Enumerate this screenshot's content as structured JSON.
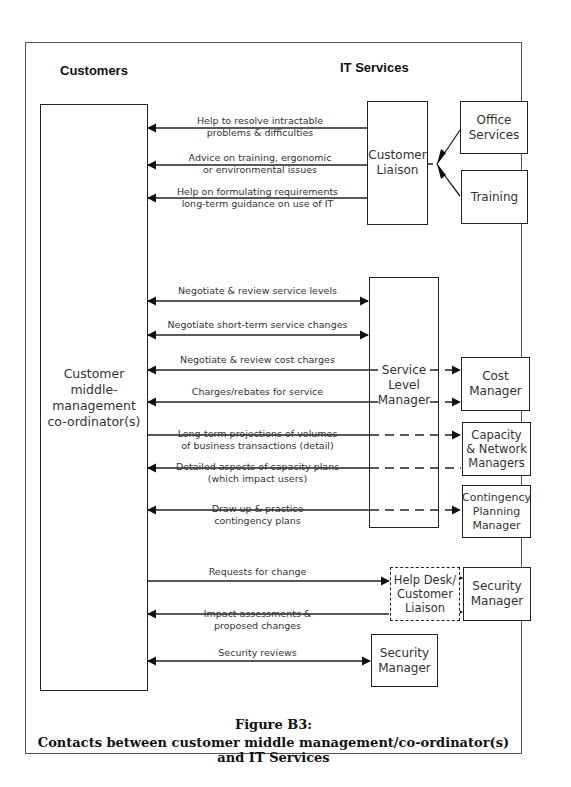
{
  "headers": {
    "customers": "Customers",
    "it_services": "IT Services"
  },
  "boxes": {
    "customer": "Customer\nmiddle-\nmanagement\nco-ordinator(s)",
    "customer_liaison": "Customer\nLiaison",
    "office_services": "Office\nServices",
    "training": "Training",
    "service_level_manager": "Service\nLevel\nManager",
    "cost_manager": "Cost\nManager",
    "capacity_network": "Capacity\n& Network\nManagers",
    "contingency": "Contingency\nPlanning\nManager",
    "helpdesk": "Help Desk/\nCustomer\nLiaison",
    "security_manager_1": "Security\nManager",
    "security_manager_2": "Security\nManager"
  },
  "flows": [
    {
      "label": "Help to resolve intractable\nproblems & difficulties",
      "from": "Customer Liaison",
      "to": "Customer",
      "direction": "to-customer"
    },
    {
      "label": "Advice on training, ergonomic\nor environmental issues",
      "from": "Customer Liaison",
      "to": "Customer",
      "direction": "to-customer"
    },
    {
      "label": "Help on formulating requirements\nlong-term guidance on use of IT",
      "from": "Customer Liaison",
      "to": "Customer",
      "direction": "to-customer"
    },
    {
      "label": "Negotiate & review service levels",
      "from": "Customer",
      "to": "Service Level Manager",
      "direction": "both"
    },
    {
      "label": "Negotiate short-term service changes",
      "from": "Customer",
      "to": "Service Level Manager",
      "direction": "both"
    },
    {
      "label": "Negotiate & review cost charges",
      "from": "Customer",
      "to": "Cost Manager",
      "direction": "both"
    },
    {
      "label": "Charges/rebates for service",
      "from": "Cost Manager",
      "to": "Customer",
      "direction": "both"
    },
    {
      "label": "Long-term projections of volumes\nof business transactions (detail)",
      "from": "Customer",
      "to": "Capacity & Network Managers",
      "direction": "to-it"
    },
    {
      "label": "Detailed aspects of capacity plans\n(which impact users)",
      "from": "Capacity & Network Managers",
      "to": "Customer",
      "direction": "to-customer"
    },
    {
      "label": "Draw up & practice\ncontingency plans",
      "from": "Customer",
      "to": "Contingency Planning Manager",
      "direction": "both"
    },
    {
      "label": "Requests for change",
      "from": "Customer",
      "to": "Help Desk/Customer Liaison",
      "direction": "to-it"
    },
    {
      "label": "Impact assessments &\nproposed changes",
      "from": "Help Desk/Customer Liaison",
      "to": "Customer",
      "direction": "both"
    },
    {
      "label": "Security reviews",
      "from": "Customer",
      "to": "Security Manager",
      "direction": "both"
    }
  ],
  "caption": {
    "title": "Figure B3:",
    "subtitle": "Contacts between customer middle management/co-ordinator(s) and IT Services"
  }
}
